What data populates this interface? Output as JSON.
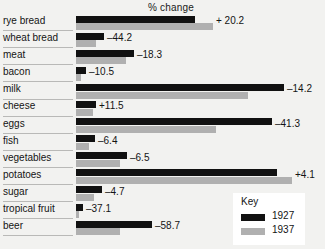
{
  "chart_data": {
    "type": "bar",
    "title": "% change",
    "xlabel": "",
    "ylabel": "",
    "orientation": "horizontal",
    "grid": false,
    "legend_position": "bottom-right",
    "legend_title": "Key",
    "categories": [
      "rye bread",
      "wheat bread",
      "meat",
      "bacon",
      "milk",
      "cheese",
      "eggs",
      "fish",
      "vegetables",
      "potatoes",
      "sugar",
      "tropical fruit",
      "beer"
    ],
    "series": [
      {
        "name": "1927",
        "color": "#111111",
        "values": [
          119,
          28,
          58,
          10,
          208,
          20,
          196,
          19,
          51,
          201,
          26,
          7,
          76
        ]
      },
      {
        "name": "1937",
        "color": "#b0b0b0",
        "values": [
          137,
          20,
          50,
          5,
          172,
          17,
          140,
          13,
          44,
          216,
          18,
          3,
          44
        ]
      }
    ],
    "value_labels": [
      "+ 20.2",
      "–44.2",
      "–18.3",
      "–10.5",
      "–14.2",
      "+11.5",
      "–41.3",
      "–6.4",
      "–6.5",
      "+4.1",
      "–4.7",
      "–37.1",
      "–58.7"
    ]
  },
  "colors": {
    "background": "#f2f2f0",
    "series_1927": "#111111",
    "series_1937": "#b0b0b0",
    "rule": "#b9b9b7",
    "text": "#141414",
    "legend_background": "#ffffff"
  }
}
